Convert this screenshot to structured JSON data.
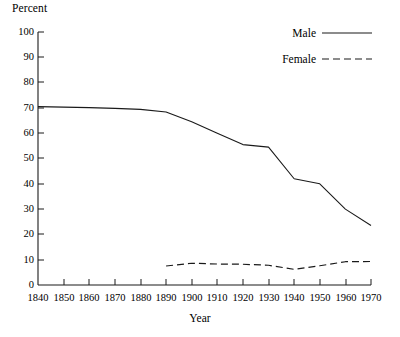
{
  "chart_data": {
    "type": "line",
    "title": "",
    "xlabel": "Year",
    "ylabel": "Percent",
    "xlim": [
      1840,
      1970
    ],
    "ylim": [
      0,
      100
    ],
    "grid": false,
    "legend_position": "top-right",
    "x_ticks": [
      1840,
      1850,
      1860,
      1870,
      1880,
      1890,
      1900,
      1910,
      1920,
      1930,
      1940,
      1950,
      1960,
      1970
    ],
    "y_ticks": [
      0,
      10,
      20,
      30,
      40,
      50,
      60,
      70,
      80,
      90,
      100
    ],
    "series": [
      {
        "name": "Male",
        "style": "solid",
        "color": "#1a1a1a",
        "x": [
          1840,
          1850,
          1860,
          1870,
          1880,
          1890,
          1900,
          1910,
          1920,
          1930,
          1940,
          1950,
          1960,
          1970
        ],
        "values": [
          70.5,
          70.3,
          70.1,
          69.8,
          69.4,
          68.4,
          64.5,
          60.0,
          55.5,
          54.5,
          42.0,
          40.0,
          30.0,
          23.5
        ]
      },
      {
        "name": "Female",
        "style": "dashed",
        "color": "#1a1a1a",
        "x": [
          1890,
          1900,
          1910,
          1920,
          1930,
          1940,
          1950,
          1960,
          1970
        ],
        "values": [
          7.5,
          8.6,
          8.3,
          8.2,
          7.8,
          6.2,
          7.6,
          9.2,
          9.3
        ]
      }
    ]
  },
  "legend": {
    "entries": [
      {
        "label": "Male",
        "style": "solid"
      },
      {
        "label": "Female",
        "style": "dashed"
      }
    ]
  },
  "axes": {
    "y_title": "Percent",
    "x_title": "Year",
    "y_tick_labels": [
      "100",
      "90",
      "80",
      "70",
      "60",
      "50",
      "40",
      "30",
      "20",
      "10",
      "0"
    ],
    "x_tick_labels": [
      "1840",
      "1850",
      "1860",
      "1870",
      "1880",
      "1890",
      "1900",
      "1910",
      "1920",
      "1930",
      "1940",
      "1950",
      "1960",
      "1970"
    ]
  }
}
